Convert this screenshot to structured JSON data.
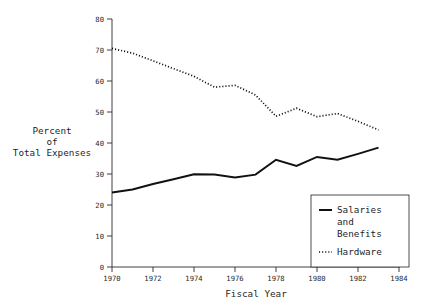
{
  "chart_data": {
    "type": "line",
    "title": "",
    "xlabel": "Fiscal Year",
    "ylabel": "Percent\nof\nTotal Expenses",
    "ylabel_lines": [
      "Percent",
      "of",
      "Total Expenses"
    ],
    "xlim": [
      1970,
      1984
    ],
    "ylim": [
      0,
      80
    ],
    "grid": false,
    "legend_position": "bottom-right",
    "x_ticks": [
      "1970",
      "1972",
      "1974",
      "1976",
      "1978",
      "1980",
      "1982",
      "1984"
    ],
    "x_tick_values": [
      1970,
      1972,
      1974,
      1976,
      1978,
      1980,
      1982,
      1984
    ],
    "y_ticks": [
      "0",
      "10",
      "20",
      "30",
      "40",
      "50",
      "60",
      "70",
      "80"
    ],
    "y_tick_values": [
      0,
      10,
      20,
      30,
      40,
      50,
      60,
      70,
      80
    ],
    "x": [
      1970,
      1971,
      1972,
      1973,
      1974,
      1975,
      1976,
      1977,
      1978,
      1979,
      1980,
      1981,
      1982,
      1983
    ],
    "series": [
      {
        "name": "Salaries and Benefits",
        "legend_label_lines": [
          "Salaries",
          "and",
          "Benefits"
        ],
        "style": "solid",
        "color": "#111111",
        "values": [
          24.0,
          25.0,
          26.8,
          28.3,
          29.9,
          29.8,
          28.9,
          29.8,
          34.6,
          32.6,
          35.5,
          34.6,
          36.5,
          38.5
        ]
      },
      {
        "name": "Hardware",
        "legend_label_lines": [
          "Hardware"
        ],
        "style": "dotted",
        "color": "#111111",
        "values": [
          70.5,
          69.0,
          66.5,
          64.0,
          61.5,
          58.0,
          58.6,
          55.5,
          48.6,
          51.2,
          48.5,
          49.5,
          47.0,
          44.2
        ]
      }
    ]
  },
  "axes": {
    "x_axis_title": "Fiscal Year",
    "y_axis_title_lines": [
      "Percent",
      "of",
      "Total Expenses"
    ]
  },
  "legend": {
    "entries": [
      {
        "label_lines": [
          "Salaries",
          "and",
          "Benefits"
        ],
        "style": "solid"
      },
      {
        "label_lines": [
          "Hardware"
        ],
        "style": "dotted"
      }
    ]
  },
  "colors": {
    "background": "#ffffff",
    "ink": "#111111",
    "axis": "#2a2a2a"
  }
}
